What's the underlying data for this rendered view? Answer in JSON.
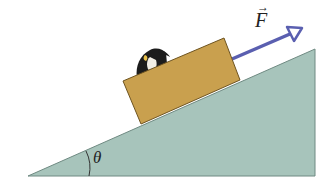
{
  "diagram": {
    "type": "physics-inclined-plane",
    "labels": {
      "force": "F",
      "force_vector_marker": "→",
      "angle": "θ"
    },
    "objects": [
      {
        "name": "incline",
        "color": "#a7c4bb"
      },
      {
        "name": "box",
        "color": "#c9a04e"
      },
      {
        "name": "penguin",
        "color": "#1c1c1c"
      },
      {
        "name": "force-arrow",
        "color": "#5a5fb0"
      }
    ]
  }
}
